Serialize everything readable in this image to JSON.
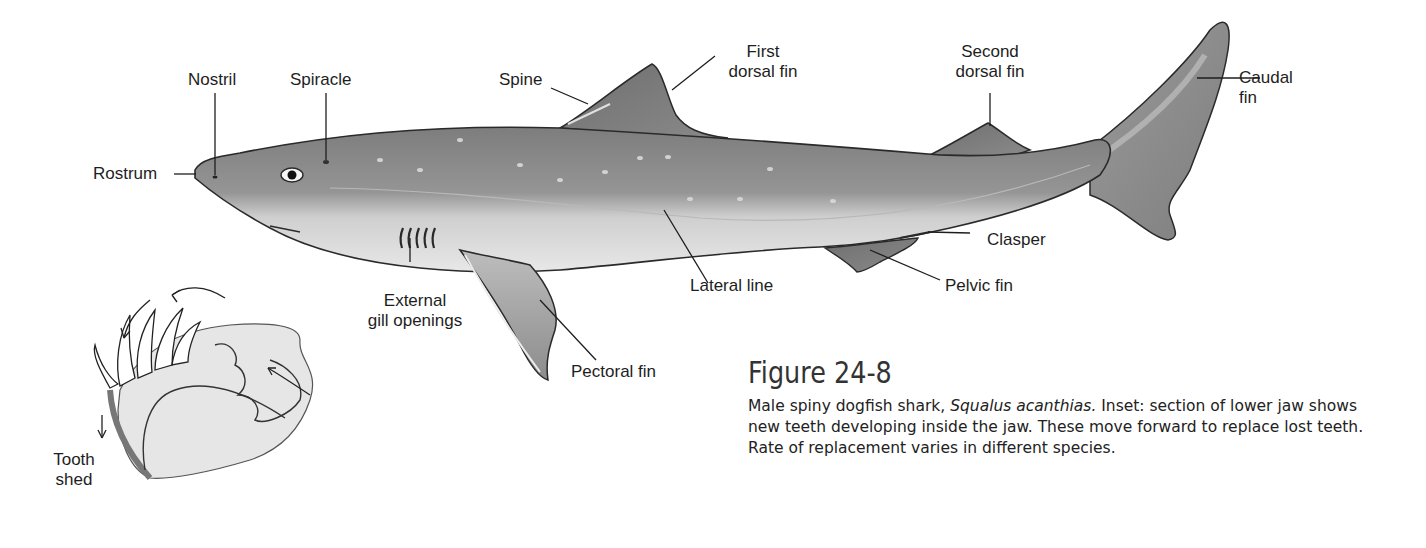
{
  "figure": {
    "number": "Figure 24-8",
    "caption": {
      "prefix": "Male spiny dogfish shark, ",
      "species": "Squalus acanthias.",
      "suffix": " Inset: section of lower jaw shows new teeth developing inside the jaw. These move forward to replace lost teeth. Rate of replacement varies in different species."
    }
  },
  "labels": {
    "nostril": "Nostril",
    "spiracle": "Spiracle",
    "spine": "Spine",
    "first_dorsal_fin": [
      "First",
      "dorsal fin"
    ],
    "second_dorsal_fin": [
      "Second",
      "dorsal fin"
    ],
    "caudal_fin": [
      "Caudal",
      "fin"
    ],
    "rostrum": "Rostrum",
    "clasper": "Clasper",
    "external_gill_openings": [
      "External",
      "gill openings"
    ],
    "lateral_line": "Lateral line",
    "pelvic_fin": "Pelvic fin",
    "pectoral_fin": "Pectoral fin",
    "tooth_shed": [
      "Tooth",
      "shed"
    ]
  },
  "colors": {
    "body_dark": "#8a8a8a",
    "body_light": "#dcdcdc",
    "fin": "#7a7a7a",
    "outline": "#2a2a2a",
    "jaw_fill": "#e6e6e6"
  }
}
